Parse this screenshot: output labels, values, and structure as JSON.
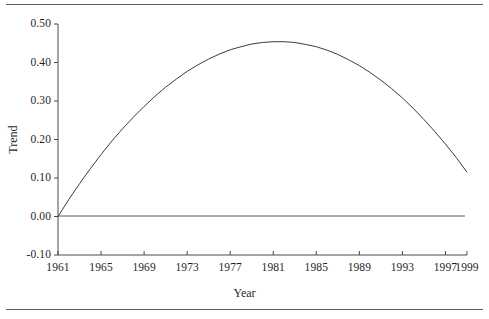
{
  "chart_data": {
    "type": "line",
    "title": "",
    "xlabel": "Year",
    "ylabel": "Trend",
    "xlim": [
      1961,
      1999
    ],
    "ylim": [
      -0.1,
      0.5
    ],
    "grid": false,
    "legend": null,
    "zero_reference_line": 0.0,
    "xticks": [
      1961,
      1965,
      1969,
      1973,
      1977,
      1981,
      1985,
      1989,
      1993,
      1997,
      1999
    ],
    "xtick_labels": [
      "1961",
      "1965",
      "1969",
      "1973",
      "1977",
      "1981",
      "1985",
      "1989",
      "1993",
      "1997",
      "1999"
    ],
    "yticks": [
      -0.1,
      0.0,
      0.1,
      0.2,
      0.3,
      0.4,
      0.5
    ],
    "ytick_labels": [
      "-0.10",
      "0.00",
      "0.10",
      "0.20",
      "0.30",
      "0.40",
      "0.50"
    ],
    "series": [
      {
        "name": "Trend",
        "color": "#3c3c3c",
        "x": [
          1961,
          1962,
          1963,
          1964,
          1965,
          1966,
          1967,
          1968,
          1969,
          1970,
          1971,
          1972,
          1973,
          1974,
          1975,
          1976,
          1977,
          1978,
          1979,
          1980,
          1981,
          1982,
          1983,
          1984,
          1985,
          1986,
          1987,
          1988,
          1989,
          1990,
          1991,
          1992,
          1993,
          1994,
          1995,
          1996,
          1997,
          1998,
          1999
        ],
        "values": [
          0.0,
          0.044,
          0.085,
          0.124,
          0.161,
          0.196,
          0.228,
          0.258,
          0.286,
          0.312,
          0.336,
          0.357,
          0.377,
          0.394,
          0.409,
          0.422,
          0.433,
          0.441,
          0.448,
          0.452,
          0.454,
          0.454,
          0.452,
          0.447,
          0.441,
          0.432,
          0.421,
          0.407,
          0.392,
          0.374,
          0.354,
          0.332,
          0.308,
          0.281,
          0.252,
          0.221,
          0.188,
          0.153,
          0.115
        ]
      }
    ],
    "annotations": {
      "peak_year": 1982,
      "peak_value": 0.475,
      "zero_crossing_year": 1998
    }
  },
  "axis": {
    "y_title": "Trend",
    "x_title": "Year"
  }
}
